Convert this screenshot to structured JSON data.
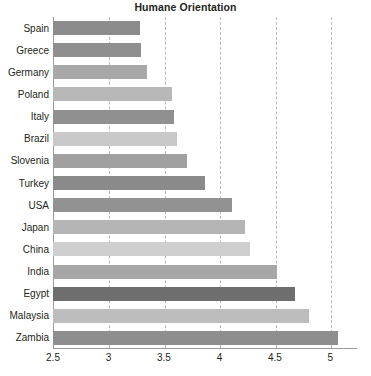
{
  "chart_data": {
    "type": "bar",
    "orientation": "horizontal",
    "title": "Humane Orientation",
    "xlabel": "",
    "ylabel": "",
    "xlim": [
      2.5,
      5.24
    ],
    "xticks": [
      2.5,
      3,
      3.5,
      4,
      4.5,
      5
    ],
    "xtick_labels": [
      "2.5",
      "3",
      "3.5",
      "4",
      "4.5",
      "5"
    ],
    "grid": "vertical-dashed",
    "legend": "none",
    "categories": [
      "Spain",
      "Greece",
      "Germany",
      "Poland",
      "Italy",
      "Brazil",
      "Slovenia",
      "Turkey",
      "USA",
      "Japan",
      "China",
      "India",
      "Egypt",
      "Malaysia",
      "Zambia"
    ],
    "values": [
      3.28,
      3.29,
      3.35,
      3.57,
      3.59,
      3.62,
      3.71,
      3.87,
      4.11,
      4.23,
      4.28,
      4.52,
      4.68,
      4.81,
      5.07
    ],
    "bar_colors": [
      "#8c8c8c",
      "#8f8f8f",
      "#a8a8a8",
      "#b8b8b8",
      "#909090",
      "#c9c9c9",
      "#a0a0a0",
      "#8a8a8a",
      "#929292",
      "#b5b5b5",
      "#cfcfcf",
      "#a6a6a6",
      "#6e6e6e",
      "#bdbdbd",
      "#8e8e8e"
    ],
    "axis_color": "#9c9c9c",
    "grid_color": "#b9b9b9",
    "text_color": "#231f20",
    "background": "#ffffff"
  }
}
